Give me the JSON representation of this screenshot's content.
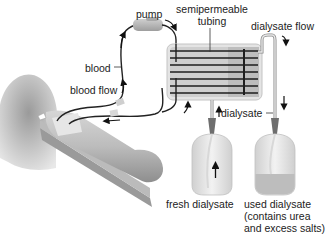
{
  "diagram": {
    "type": "hemodialysis",
    "labels": {
      "pump": "pump",
      "semipermeable_line1": "semipermeable",
      "semipermeable_line2": "tubing",
      "dialysate_flow": "dialysate flow",
      "blood": "blood",
      "blood_flow": "blood flow",
      "dialysate": "dialysate",
      "fresh_dialysate": "fresh dialysate",
      "used_dialysate_line1": "used dialysate",
      "used_dialysate_line2": "(contains urea",
      "used_dialysate_line3": "and excess salts)"
    },
    "colors": {
      "tube": "#222222",
      "machine_body": "#d4d4d4",
      "machine_border": "#b8b8b8",
      "pump": "#b0b0b0",
      "bag": "#e6e6e6",
      "used_fluid": "#c8c8c8",
      "arm": "#bdbdbd",
      "shoulder": "#8a8a8a"
    }
  }
}
